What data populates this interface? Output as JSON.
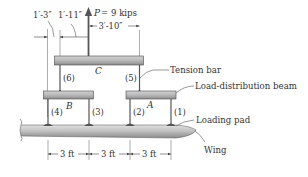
{
  "figure": {
    "load": {
      "symbol": "P",
      "equals": "= 9 kips",
      "value": 9,
      "unit": "kips"
    },
    "dimensions": {
      "top_left_1": "1′-3″",
      "top_left_2": "1′-11″",
      "top_right": "3′-10″",
      "bottom": [
        "3 ft",
        "3 ft",
        "3 ft"
      ]
    },
    "beams": {
      "top": "C",
      "left": "B",
      "right": "A"
    },
    "bars": [
      "(1)",
      "(2)",
      "(3)",
      "(4)",
      "(5)",
      "(6)"
    ],
    "callouts": {
      "tension_bar": "Tension bar",
      "load_distribution_beam": "Load-distribution beam",
      "loading_pad": "Loading pad",
      "wing": "Wing"
    }
  },
  "colors": {
    "beam_fill": "#b9b9b9",
    "beam_stroke": "#4a4a4a",
    "wing_fill": "#c4c4c4",
    "line": "#444444"
  }
}
